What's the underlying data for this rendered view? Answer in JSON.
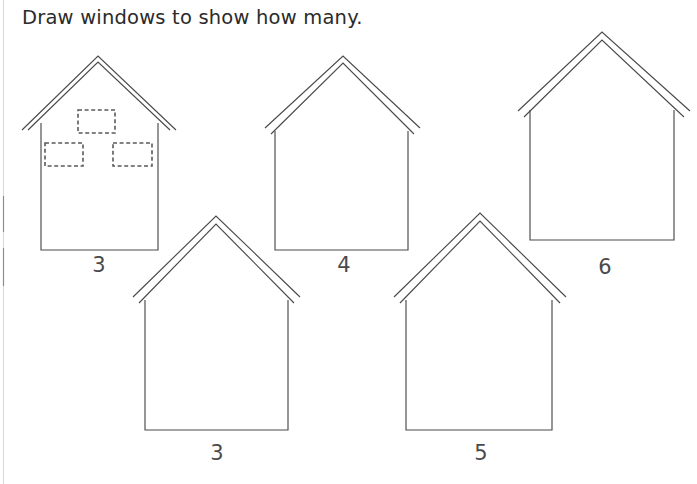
{
  "worksheet": {
    "title": "Draw windows to show how many.",
    "background_color": "#ffffff",
    "stroke_color": "#4a4a4a",
    "window_stroke_color": "#5a5a5a",
    "label_color": "#4a4a4a",
    "title_color": "#2b2b2b"
  },
  "houses": [
    {
      "id": "house-1",
      "count_label": "3",
      "windows_drawn": 3,
      "is_example": true,
      "windows": [
        {
          "name": "window-top-center",
          "x": 78,
          "y": 110,
          "width": 37,
          "height": 23
        },
        {
          "name": "window-lower-left",
          "x": 45,
          "y": 143,
          "width": 38,
          "height": 23
        },
        {
          "name": "window-lower-right",
          "x": 113,
          "y": 143,
          "width": 39,
          "height": 23
        }
      ]
    },
    {
      "id": "house-2",
      "count_label": "4",
      "windows_drawn": 0,
      "is_example": false,
      "windows": []
    },
    {
      "id": "house-3",
      "count_label": "6",
      "windows_drawn": 0,
      "is_example": false,
      "windows": []
    },
    {
      "id": "house-4",
      "count_label": "3",
      "windows_drawn": 0,
      "is_example": false,
      "windows": []
    },
    {
      "id": "house-5",
      "count_label": "5",
      "windows_drawn": 0,
      "is_example": false,
      "windows": []
    }
  ]
}
